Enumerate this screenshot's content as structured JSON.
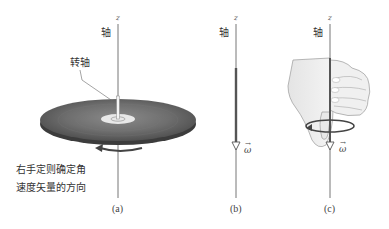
{
  "figure": {
    "panels": [
      {
        "id": "a",
        "caption": "(a)",
        "axis_z_label": "z",
        "axis_label": "轴",
        "spindle_label": "转轴",
        "note_lines": [
          "右手定则确定角",
          "速度矢量的方向"
        ],
        "rotation_arrow": "counterclockwise-arrow"
      },
      {
        "id": "b",
        "caption": "(b)",
        "axis_z_label": "z",
        "axis_label": "轴",
        "vector_label": "ω"
      },
      {
        "id": "c",
        "caption": "(c)",
        "axis_z_label": "z",
        "axis_label": "轴",
        "vector_label": "ω",
        "illustration": "right-hand-grip"
      }
    ],
    "vector_arrow_symbol": "→"
  }
}
